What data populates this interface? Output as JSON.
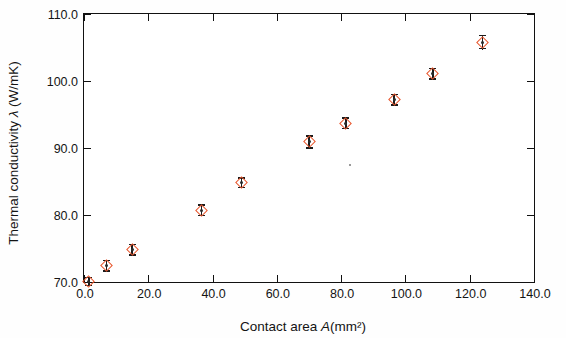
{
  "chart_data": {
    "type": "scatter",
    "title": "",
    "xlabel": "Contact area A(mm²)",
    "ylabel": "Thermal conductivity λ (W/mK)",
    "xlim": [
      0.0,
      140.0
    ],
    "ylim": [
      70.0,
      110.0
    ],
    "xticks": [
      "0.0",
      "20.0",
      "40.0",
      "60.0",
      "80.0",
      "100.0",
      "120.0",
      "140.0"
    ],
    "xtick_values": [
      0,
      20,
      40,
      60,
      80,
      100,
      120,
      140
    ],
    "yticks": [
      "70.0",
      "80.0",
      "90.0",
      "100.0",
      "110.0"
    ],
    "ytick_values": [
      70,
      80,
      90,
      100,
      110
    ],
    "grid": false,
    "legend": null,
    "marker": "open-diamond",
    "marker_color": "#e8542a",
    "errorbar_color": "#1b1b1b",
    "series": [
      {
        "name": "Thermal conductivity vs contact area",
        "x": [
          1.5,
          7.0,
          15.0,
          36.5,
          49.0,
          70.0,
          81.5,
          96.5,
          108.5,
          124.0
        ],
        "y": [
          70.1,
          72.4,
          74.8,
          80.7,
          84.8,
          90.9,
          93.7,
          97.2,
          101.1,
          105.8
        ],
        "yerr": [
          0.7,
          0.9,
          0.9,
          0.9,
          0.8,
          1.0,
          0.9,
          0.9,
          0.9,
          1.1
        ]
      }
    ]
  },
  "axis_titles": {
    "y_prefix": "Thermal conductivity ",
    "y_symbol": "λ",
    "y_suffix": " (W/mK)",
    "x_prefix": "Contact area ",
    "x_symbol": "A",
    "x_suffix": "(mm²)"
  }
}
